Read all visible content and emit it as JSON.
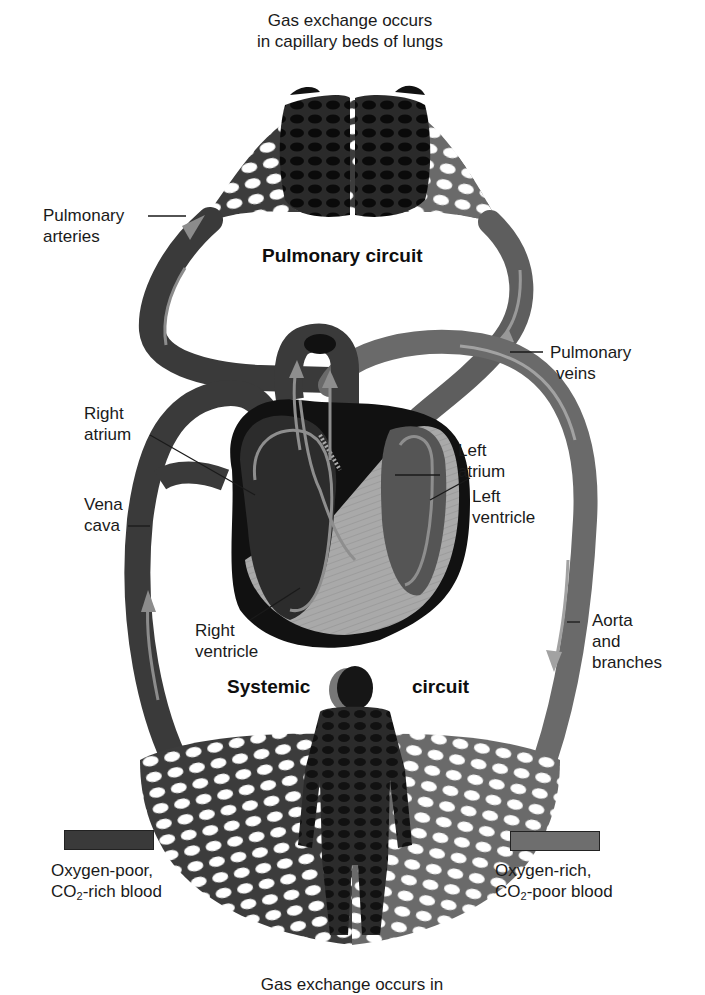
{
  "diagram": {
    "title_top": [
      "Gas exchange occurs",
      "in capillary beds of lungs"
    ],
    "title_bottom": "Gas exchange occurs in",
    "circuits": {
      "pulmonary": "Pulmonary circuit",
      "systemic_left": "Systemic",
      "systemic_right": "circuit"
    },
    "labels": {
      "pulmonary_arteries": [
        "Pulmonary",
        "arteries"
      ],
      "pulmonary_veins": [
        "Pulmonary",
        "veins"
      ],
      "right_atrium": [
        "Right",
        "atrium"
      ],
      "vena_cava": [
        "Vena",
        "cava"
      ],
      "left_atrium": [
        "Left",
        "atrium"
      ],
      "left_ventricle": [
        "Left",
        "ventricle"
      ],
      "right_ventricle": [
        "Right",
        "ventricle"
      ],
      "aorta": [
        "Aorta",
        "and",
        "branches"
      ]
    },
    "legend": {
      "oxygen_poor": {
        "line1": "Oxygen-poor,",
        "co2_prefix": "CO",
        "co2_sub": "2",
        "co2_suffix": "-rich blood",
        "color": "#3a3a3a"
      },
      "oxygen_rich": {
        "line1": "Oxygen-rich,",
        "co2_prefix": "CO",
        "co2_sub": "2",
        "co2_suffix": "-poor blood",
        "color": "#6e6e6e"
      }
    },
    "colors": {
      "oxygen_poor_vessel": "#3a3a3a",
      "oxygen_rich_vessel": "#6a6a6a",
      "flow_arrow": "#9a9a9a",
      "heart_muscle": "#a8a8a8",
      "heart_outline": "#111111",
      "body_silhouette": "#161616"
    }
  }
}
